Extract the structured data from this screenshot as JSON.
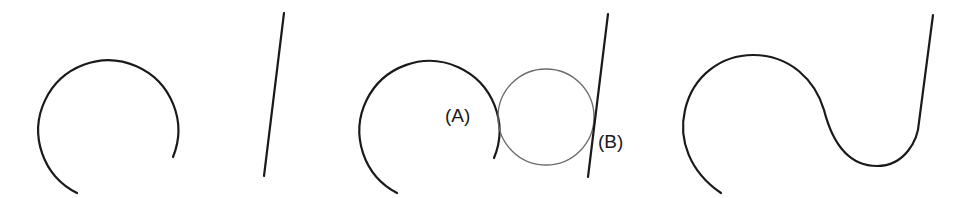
{
  "diagram": {
    "panels": [
      {
        "id": "panel-1",
        "elements": [
          {
            "type": "arc",
            "center": [
              108,
              124
            ],
            "radius": 70,
            "start": [
              77,
              193
            ],
            "end": [
              173,
              157
            ]
          },
          {
            "type": "line",
            "from": [
              284,
              13
            ],
            "to": [
              264,
              176
            ]
          }
        ]
      },
      {
        "id": "panel-2",
        "elements": [
          {
            "type": "arc",
            "center": [
              428,
              124
            ],
            "radius": 70,
            "start": [
              397,
              193
            ],
            "end": [
              494,
              158
            ]
          },
          {
            "type": "fillet-circle",
            "center": [
              546,
              117
            ],
            "radius": 48
          },
          {
            "type": "line",
            "from": [
              608,
              14
            ],
            "to": [
              588,
              177
            ]
          }
        ],
        "labels": [
          {
            "text": "(A)",
            "meaning": "tangent point between arc and fillet circle"
          },
          {
            "text": "(B)",
            "meaning": "tangent point between fillet circle and line"
          }
        ]
      },
      {
        "id": "panel-3",
        "elements": [
          {
            "type": "blended-curve",
            "description": "arc joined to line through fillet"
          }
        ]
      }
    ],
    "colors": {
      "stroke": "#1a1a1a",
      "fillet_circle": "#6b6b6b",
      "background": "#ffffff"
    }
  }
}
